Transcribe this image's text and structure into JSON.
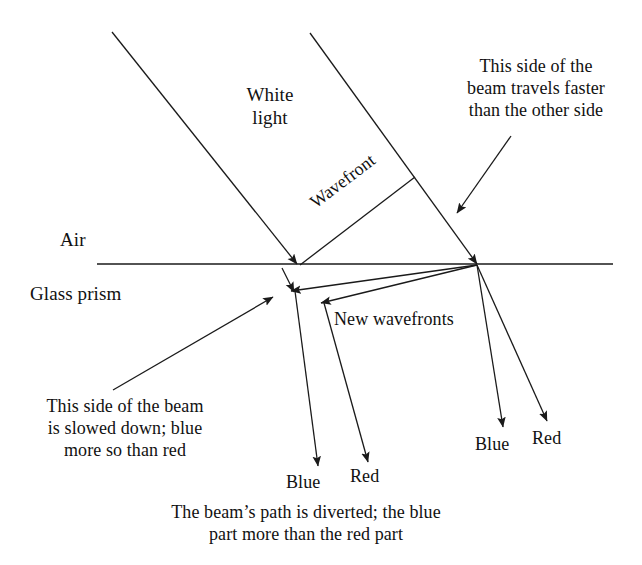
{
  "figure": {
    "stroke_color": "#1a1a1a",
    "background_color": "#ffffff",
    "text_color": "#111111"
  },
  "labels": {
    "air": "Air",
    "glass_prism": "Glass prism",
    "white_light": "White\nlight",
    "wavefront": "Wavefront",
    "new_wavefronts": "New wavefronts",
    "faster_side": "This side of the\nbeam travels faster\nthan the other side",
    "slowed_side": "This side of the beam\nis slowed down; blue\nmore so than red",
    "blue_left": "Blue",
    "red_left": "Red",
    "blue_right": "Blue",
    "red_right": "Red",
    "caption": "The beam’s path is diverted; the blue\npart more than the red part"
  },
  "geometry": {
    "interface_line": {
      "x1": 97,
      "y1": 264,
      "x2": 613,
      "y2": 264
    },
    "incident_ray_left": {
      "x1": 112,
      "y1": 32,
      "x2": 297,
      "y2": 264
    },
    "incident_ray_right": {
      "x1": 310,
      "y1": 33,
      "x2": 477,
      "y2": 264
    },
    "wavefront_line": {
      "x1": 300,
      "y1": 265,
      "x2": 415,
      "y2": 177
    },
    "new_wavefront_blue": {
      "x1": 477,
      "y1": 265,
      "x2": 291,
      "y2": 291
    },
    "new_wavefront_red": {
      "x1": 477,
      "y1": 265,
      "x2": 321,
      "y2": 303
    },
    "refracted_blue_left": {
      "x1": 295,
      "y1": 291,
      "x2": 318,
      "y2": 466
    },
    "refracted_red_left": {
      "x1": 324,
      "y1": 303,
      "x2": 368,
      "y2": 462
    },
    "refracted_blue_right": {
      "x1": 477,
      "y1": 265,
      "x2": 503,
      "y2": 427
    },
    "refracted_red_right": {
      "x1": 477,
      "y1": 265,
      "x2": 547,
      "y2": 421
    },
    "short_drop_arrow": {
      "x1": 282,
      "y1": 268,
      "x2": 294,
      "y2": 292
    },
    "callout_faster": {
      "x1": 511,
      "y1": 136,
      "x2": 457,
      "y2": 213
    },
    "callout_slowed": {
      "x1": 113,
      "y1": 390,
      "x2": 273,
      "y2": 297
    }
  }
}
